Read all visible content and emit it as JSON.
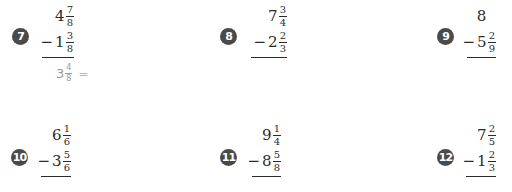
{
  "problems": [
    {
      "number": "7",
      "top": {
        "whole": "4",
        "num": "7",
        "den": "8"
      },
      "bottom": {
        "sign": "−",
        "whole": "1",
        "num": "3",
        "den": "8"
      },
      "answer": {
        "whole": "3",
        "num": "4",
        "den": "8",
        "eq": "="
      }
    },
    {
      "number": "8",
      "top": {
        "whole": "7",
        "num": "3",
        "den": "4"
      },
      "bottom": {
        "sign": "−",
        "whole": "2",
        "num": "2",
        "den": "3"
      }
    },
    {
      "number": "9",
      "top": {
        "whole": "8"
      },
      "bottom": {
        "sign": "−",
        "whole": "5",
        "num": "2",
        "den": "9"
      }
    },
    {
      "number": "10",
      "top": {
        "whole": "6",
        "num": "1",
        "den": "6"
      },
      "bottom": {
        "sign": "−",
        "whole": "3",
        "num": "5",
        "den": "6"
      }
    },
    {
      "number": "11",
      "top": {
        "whole": "9",
        "num": "1",
        "den": "4"
      },
      "bottom": {
        "sign": "−",
        "whole": "8",
        "num": "5",
        "den": "8"
      }
    },
    {
      "number": "12",
      "top": {
        "whole": "7",
        "num": "2",
        "den": "5"
      },
      "bottom": {
        "sign": "−",
        "whole": "1",
        "num": "2",
        "den": "3"
      }
    }
  ],
  "colors": {
    "badge": "#4a4a4a",
    "text": "#2b2b2b",
    "answer": "#9a9a9a"
  }
}
